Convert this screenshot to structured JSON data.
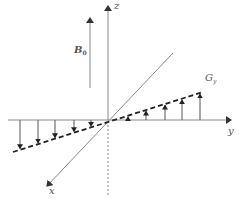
{
  "diagram": {
    "title": "",
    "colors": {
      "axis": "#8a8a8a",
      "arrow": "#333333",
      "dashed": "#222222",
      "label": "#555555"
    },
    "labels": {
      "z_axis": "z",
      "y_axis": "y",
      "x_axis": "x",
      "field_main": "B",
      "field_sub": "0",
      "gradient_main": "G",
      "gradient_sub": "y"
    },
    "origin": [
      108,
      120
    ],
    "axes": {
      "z": {
        "from": [
          108,
          120
        ],
        "to": [
          108,
          4
        ],
        "dashed_below_to": [
          108,
          196
        ]
      },
      "y": {
        "from": [
          8,
          120
        ],
        "to": [
          233,
          120
        ]
      },
      "x": {
        "from": [
          173,
          53
        ],
        "to": [
          46,
          187
        ]
      }
    },
    "b0_arrow": {
      "x": 90,
      "y_from": 88,
      "y_to": 17
    },
    "gradient_line": {
      "from": [
        13,
        152
      ],
      "to": [
        203,
        92
      ]
    },
    "down_arrows_x": [
      20,
      38,
      55,
      74,
      91
    ],
    "up_arrows_x": [
      128,
      146,
      165,
      182,
      200
    ]
  }
}
